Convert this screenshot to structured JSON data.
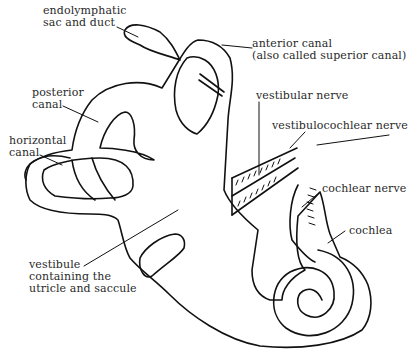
{
  "diagram": {
    "stroke_color": "#111111",
    "text_color": "#2a2a2a",
    "background": "#ffffff",
    "labels": {
      "endolymphatic_1": "endolymphatic",
      "endolymphatic_2": "sac and duct",
      "anterior_1": "anterior canal",
      "anterior_2": "(also called superior canal)",
      "posterior_1": "posterior",
      "posterior_2": "canal",
      "horizontal_1": "horizontal",
      "horizontal_2": "canal",
      "vestibular_nerve": "vestibular nerve",
      "vestibulocochlear_nerve": "vestibulocochlear nerve",
      "cochlear_nerve": "cochlear nerve",
      "cochlea": "cochlea",
      "vestibule_1": "vestibule",
      "vestibule_2": "containing the",
      "vestibule_3": "utricle and saccule"
    }
  }
}
